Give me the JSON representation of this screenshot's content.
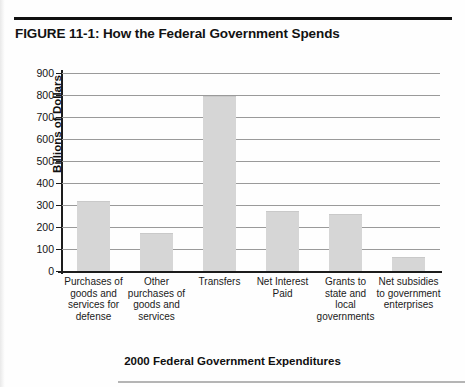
{
  "figure": {
    "title": "FIGURE 11-1: How the Federal Government Spends"
  },
  "chart_data": {
    "type": "bar",
    "title": "FIGURE 11-1: How the Federal Government Spends",
    "xlabel": "2000 Federal Government Expenditures",
    "ylabel": "Billions of Dollars",
    "ylim": [
      0,
      900
    ],
    "ytick_step": 100,
    "yticks": [
      0,
      100,
      200,
      300,
      400,
      500,
      600,
      700,
      800,
      900
    ],
    "ytick_labels": [
      "0",
      "100",
      "200",
      "300",
      "400",
      "500",
      "600",
      "700",
      "800",
      "900"
    ],
    "grid": true,
    "legend": false,
    "bar_color": "#d6d6d6",
    "categories": [
      "Purchases of goods and services for defense",
      "Other purchases of goods and services",
      "Transfers",
      "Net Interest Paid",
      "Grants to state and local governments",
      "Net subsidies to government enterprises"
    ],
    "category_lines": [
      [
        "Purchases of",
        "goods and",
        "services for",
        "defense"
      ],
      [
        "Other",
        "purchases of",
        "goods and",
        "services"
      ],
      [
        "Transfers"
      ],
      [
        "Net Interest",
        "Paid"
      ],
      [
        "Grants to",
        "state and",
        "local",
        "governments"
      ],
      [
        "Net subsidies",
        "to government",
        "enterprises"
      ]
    ],
    "values": [
      315,
      170,
      790,
      270,
      255,
      60
    ]
  }
}
